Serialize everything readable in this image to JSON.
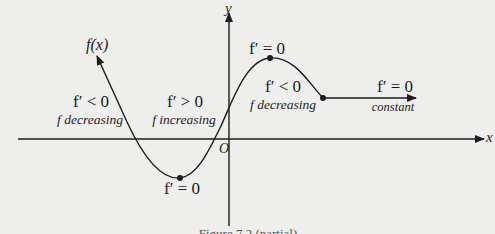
{
  "diagram": {
    "type": "function-derivative-sign-diagram",
    "colors": {
      "background": "#eeeeec",
      "ink": "#1c1c1c"
    },
    "axes": {
      "x_label": "x",
      "y_label": "y",
      "origin_label": "O"
    },
    "curve_label": "f(x)",
    "regions": [
      {
        "id": "left",
        "condition": "f′ < 0",
        "description": "f decreasing"
      },
      {
        "id": "middle",
        "condition": "f′ > 0",
        "description": "f increasing"
      },
      {
        "id": "right-falling",
        "condition": "f′ < 0",
        "description": "f decreasing"
      },
      {
        "id": "flat",
        "condition": "f′ = 0",
        "description": "constant"
      }
    ],
    "critical_points": [
      {
        "id": "minimum",
        "label": "f′ = 0"
      },
      {
        "id": "maximum",
        "label": "f′ = 0"
      }
    ],
    "caption": "Figure 7.2 (partial)"
  }
}
